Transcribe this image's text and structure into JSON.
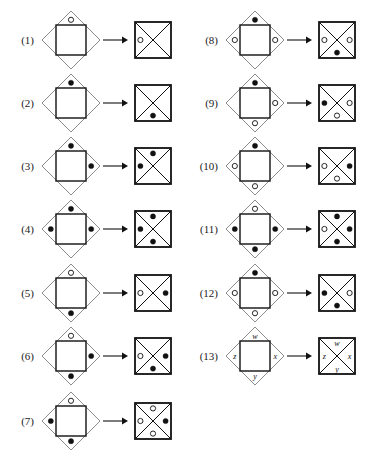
{
  "figure": {
    "type": "diagram",
    "mark_types": {
      "filled": "filled-dot",
      "open": "open-circle",
      "none": "no-mark"
    },
    "colors": {
      "ink": "#111111",
      "diamond_outline": "#8c8c8c",
      "square_outline": "#111111",
      "page_background": "#ffffff"
    },
    "positions": [
      "top",
      "right",
      "bottom",
      "left"
    ],
    "items": [
      {
        "label": "(1)",
        "source": {
          "top": "open",
          "right": "none",
          "bottom": "none",
          "left": "none"
        },
        "result": {
          "top": "none",
          "right": "none",
          "bottom": "none",
          "left": "open"
        }
      },
      {
        "label": "(2)",
        "source": {
          "top": "filled",
          "right": "none",
          "bottom": "none",
          "left": "none"
        },
        "result": {
          "top": "none",
          "right": "none",
          "bottom": "filled",
          "left": "none"
        }
      },
      {
        "label": "(3)",
        "source": {
          "top": "filled",
          "right": "filled",
          "bottom": "none",
          "left": "none"
        },
        "result": {
          "top": "filled",
          "right": "none",
          "bottom": "none",
          "left": "filled"
        }
      },
      {
        "label": "(4)",
        "source": {
          "top": "filled",
          "right": "filled",
          "bottom": "none",
          "left": "filled"
        },
        "result": {
          "top": "filled",
          "right": "none",
          "bottom": "filled",
          "left": "filled"
        }
      },
      {
        "label": "(5)",
        "source": {
          "top": "open",
          "right": "none",
          "bottom": "filled",
          "left": "none"
        },
        "result": {
          "top": "none",
          "right": "filled",
          "bottom": "none",
          "left": "open"
        }
      },
      {
        "label": "(6)",
        "source": {
          "top": "open",
          "right": "filled",
          "bottom": "filled",
          "left": "none"
        },
        "result": {
          "top": "none",
          "right": "filled",
          "bottom": "filled",
          "left": "open"
        }
      },
      {
        "label": "(7)",
        "source": {
          "top": "open",
          "right": "none",
          "bottom": "filled",
          "left": "filled"
        },
        "result": {
          "top": "open",
          "right": "filled",
          "bottom": "open",
          "left": "open"
        }
      },
      {
        "label": "(8)",
        "source": {
          "top": "filled",
          "right": "open",
          "bottom": "none",
          "left": "open"
        },
        "result": {
          "top": "none",
          "right": "open",
          "bottom": "filled",
          "left": "open"
        }
      },
      {
        "label": "(9)",
        "source": {
          "top": "filled",
          "right": "open",
          "bottom": "open",
          "left": "none"
        },
        "result": {
          "top": "none",
          "right": "open",
          "bottom": "open",
          "left": "filled"
        }
      },
      {
        "label": "(10)",
        "source": {
          "top": "filled",
          "right": "none",
          "bottom": "open",
          "left": "open"
        },
        "result": {
          "top": "none",
          "right": "filled",
          "bottom": "open",
          "left": "open"
        }
      },
      {
        "label": "(11)",
        "source": {
          "top": "open",
          "right": "filled",
          "bottom": "filled",
          "left": "filled"
        },
        "result": {
          "top": "filled",
          "right": "filled",
          "bottom": "filled",
          "left": "open"
        }
      },
      {
        "label": "(12)",
        "source": {
          "top": "filled",
          "right": "open",
          "bottom": "open",
          "left": "open"
        },
        "result": {
          "top": "none",
          "right": "open",
          "bottom": "filled",
          "left": "filled"
        }
      },
      {
        "label": "(13)",
        "source": {
          "top": "w",
          "right": "x",
          "bottom": "y",
          "left": "z"
        },
        "result": {
          "top": "w",
          "right": "x",
          "bottom": "y",
          "left": "z"
        },
        "mark_style": "letters"
      }
    ]
  }
}
